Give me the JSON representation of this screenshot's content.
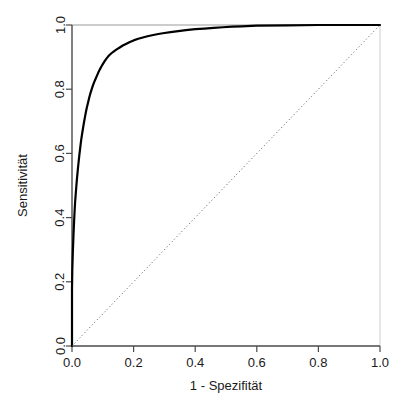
{
  "chart_data": {
    "type": "line",
    "title": "",
    "subtitle": "",
    "xlabel": "1 - Spezifität",
    "ylabel": "Sensitivität",
    "xlim": [
      0.0,
      1.0
    ],
    "ylim": [
      0.0,
      1.0
    ],
    "grid": false,
    "legend": null,
    "legend_position": "none",
    "xticks": [
      "0.0",
      "0.2",
      "0.4",
      "0.6",
      "0.8",
      "1.0"
    ],
    "xtick_values": [
      0.0,
      0.2,
      0.4,
      0.6,
      0.8,
      1.0
    ],
    "yticks": [
      "0.0",
      "0.2",
      "0.4",
      "0.6",
      "0.8",
      "1.0"
    ],
    "ytick_values": [
      0.0,
      0.2,
      0.4,
      0.6,
      0.8,
      1.0
    ],
    "series": [
      {
        "name": "ROC-Kurve",
        "style": "solid",
        "color": "#000000",
        "width": 2.2,
        "x": [
          0.0,
          0.0,
          0.0,
          0.001,
          0.002,
          0.003,
          0.004,
          0.005,
          0.006,
          0.007,
          0.008,
          0.009,
          0.01,
          0.012,
          0.014,
          0.016,
          0.018,
          0.02,
          0.022,
          0.024,
          0.026,
          0.028,
          0.03,
          0.033,
          0.036,
          0.039,
          0.042,
          0.045,
          0.048,
          0.052,
          0.056,
          0.06,
          0.064,
          0.068,
          0.072,
          0.076,
          0.08,
          0.085,
          0.09,
          0.095,
          0.1,
          0.105,
          0.11,
          0.115,
          0.12,
          0.128,
          0.136,
          0.145,
          0.155,
          0.165,
          0.175,
          0.188,
          0.2,
          0.215,
          0.23,
          0.245,
          0.26,
          0.28,
          0.3,
          0.32,
          0.345,
          0.37,
          0.4,
          0.43,
          0.46,
          0.49,
          0.52,
          0.55,
          0.6,
          0.7,
          0.8,
          0.9,
          1.0
        ],
        "y": [
          0.0,
          0.09,
          0.175,
          0.24,
          0.27,
          0.3,
          0.325,
          0.35,
          0.372,
          0.392,
          0.412,
          0.43,
          0.447,
          0.472,
          0.497,
          0.52,
          0.54,
          0.56,
          0.578,
          0.596,
          0.612,
          0.628,
          0.643,
          0.662,
          0.68,
          0.697,
          0.713,
          0.728,
          0.742,
          0.758,
          0.774,
          0.788,
          0.8,
          0.812,
          0.822,
          0.831,
          0.84,
          0.851,
          0.861,
          0.87,
          0.878,
          0.886,
          0.893,
          0.899,
          0.905,
          0.912,
          0.918,
          0.924,
          0.93,
          0.936,
          0.941,
          0.947,
          0.952,
          0.957,
          0.961,
          0.965,
          0.968,
          0.972,
          0.975,
          0.978,
          0.981,
          0.984,
          0.987,
          0.989,
          0.991,
          0.993,
          0.995,
          0.996,
          0.998,
          0.999,
          1.0,
          1.0,
          1.0
        ]
      },
      {
        "name": "Referenzlinie",
        "style": "dotted",
        "color": "#555555",
        "width": 1,
        "x": [
          0.0,
          1.0
        ],
        "y": [
          0.0,
          1.0
        ]
      }
    ]
  }
}
